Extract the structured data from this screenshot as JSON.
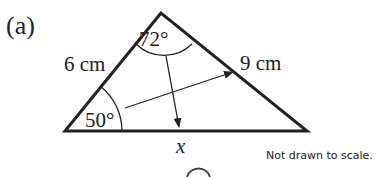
{
  "part_label": "(a)",
  "triangle": {
    "side_left": "6 cm",
    "side_right": "9 cm",
    "side_bottom": "x",
    "angle_top": "72°",
    "angle_left": "50°"
  },
  "note": "Not drawn to scale."
}
